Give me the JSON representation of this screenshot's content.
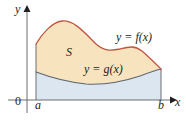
{
  "figure": {
    "kind": "calculus-area-between-curves-diagram",
    "axes": {
      "y_axis_label": "y",
      "x_axis_label": "x",
      "origin_label": "0",
      "x_tick_left_label": "a",
      "x_tick_right_label": "b",
      "axis_color": "#6d6e71"
    },
    "labels": {
      "region_label": "S",
      "upper_curve_label": "y = f(x)",
      "lower_curve_label": "y = g(x)"
    },
    "colors": {
      "upper_region_fill": "#f7e3bd",
      "lower_region_fill": "#dbe6f0",
      "upper_curve_stroke": "#c0563f",
      "lower_curve_stroke": "#5c6670",
      "boundary_stroke": "#6d6e71",
      "text": "#231f20",
      "background": "#ffffff"
    },
    "geometry": {
      "y_axis_x": 27,
      "x_axis_y": 100,
      "a_x": 36,
      "b_x": 161,
      "upper_curve_points": "36,44 48,28 62,21 78,27 96,44 112,50 124,48 133,46 146,54 161,69",
      "lower_curve_points": "36,72 56,79 78,83 98,84 120,81 142,75 161,69",
      "f_path": "M 36,44 C 42,34 52,22 62,21 C 74,20 84,32 96,44 C 104,51 110,51 120,49 C 128,47 134,45 142,51 C 150,58 156,64 161,69",
      "g_path": "M 36,72 C 52,78 68,82 86,84 C 104,85 122,82 140,76 C 148,73 156,70 161,69"
    }
  }
}
